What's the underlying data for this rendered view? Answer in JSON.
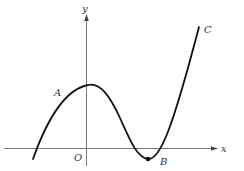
{
  "diagram": {
    "type": "function-graph",
    "axes": {
      "x_label": "x",
      "y_label": "y",
      "origin_label": "O"
    },
    "points": [
      {
        "id": "A",
        "label": "A",
        "description": "point on curve, left of local maximum"
      },
      {
        "id": "B",
        "label": "B",
        "description": "local minimum (marked with dot), below x-axis"
      },
      {
        "id": "C",
        "label": "C",
        "description": "upper end of curve"
      }
    ],
    "curve": {
      "description": "cubic-like curve: rises from below x-axis on left, local max just right of y-axis, dips to minimum B below x-axis, rises steeply to C"
    },
    "colors": {
      "curve": "#111111",
      "axes": "#555555",
      "labels": "#333333"
    }
  }
}
